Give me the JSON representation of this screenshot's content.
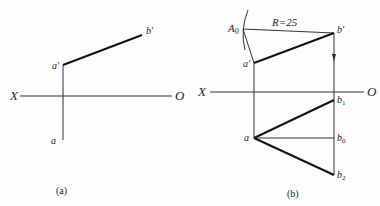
{
  "panels": [
    {
      "caption": "(a)",
      "axis": {
        "left_label": "X",
        "right_label": "O"
      },
      "points": {
        "a_prime": "a′",
        "b_prime": "b′",
        "a": "a"
      }
    },
    {
      "caption": "(b)",
      "axis": {
        "left_label": "X",
        "right_label": "O"
      },
      "annotation": "R=25",
      "points": {
        "A0": "A",
        "A0_sub": "0",
        "a_prime": "a′",
        "b_prime": "b′",
        "a": "a",
        "b1": "b",
        "b1_sub": "1",
        "b0": "b",
        "b0_sub": "0",
        "b2": "b",
        "b2_sub": "2"
      }
    }
  ],
  "colors": {
    "line": "#1a1a1a",
    "thin": "#333333",
    "background": "#fdfdfd"
  }
}
